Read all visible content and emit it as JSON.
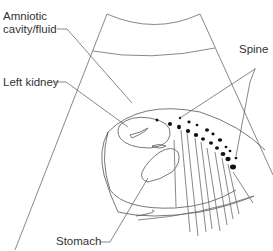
{
  "diagram": {
    "labels": {
      "amniotic": [
        "Amniotic",
        "cavity/fluid"
      ],
      "left_kidney": "Left kidney",
      "spine": "Spine",
      "stomach": "Stomach"
    },
    "colors": {
      "line": "#6a6a6a",
      "text": "#333333",
      "dots": "#111111",
      "background": "#ffffff"
    }
  }
}
